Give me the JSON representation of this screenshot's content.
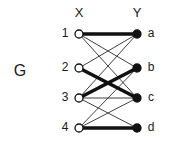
{
  "figure": {
    "graph_name": "G",
    "set_labels": {
      "left": "X",
      "right": "Y"
    },
    "left_vertices": [
      {
        "label": "1",
        "id": "1",
        "cx": 79,
        "cy": 34,
        "style": "open"
      },
      {
        "label": "2",
        "id": "2",
        "cx": 79,
        "cy": 68,
        "style": "open"
      },
      {
        "label": "3",
        "id": "3",
        "cx": 79,
        "cy": 98,
        "style": "open"
      },
      {
        "label": "4",
        "id": "4",
        "cx": 79,
        "cy": 128,
        "style": "open"
      }
    ],
    "right_vertices": [
      {
        "label": "a",
        "id": "a",
        "cx": 137,
        "cy": 34,
        "style": "filled"
      },
      {
        "label": "b",
        "id": "b",
        "cx": 137,
        "cy": 68,
        "style": "filled"
      },
      {
        "label": "c",
        "id": "c",
        "cx": 137,
        "cy": 98,
        "style": "filled"
      },
      {
        "label": "d",
        "id": "d",
        "cx": 137,
        "cy": 128,
        "style": "filled"
      }
    ],
    "edges": [
      {
        "from": "1",
        "to": "a",
        "weight": "thick"
      },
      {
        "from": "1",
        "to": "b",
        "weight": "thin"
      },
      {
        "from": "1",
        "to": "c",
        "weight": "thin"
      },
      {
        "from": "2",
        "to": "a",
        "weight": "thin"
      },
      {
        "from": "2",
        "to": "c",
        "weight": "thick"
      },
      {
        "from": "3",
        "to": "a",
        "weight": "thin"
      },
      {
        "from": "3",
        "to": "b",
        "weight": "thick"
      },
      {
        "from": "3",
        "to": "c",
        "weight": "thin"
      },
      {
        "from": "3",
        "to": "d",
        "weight": "thin"
      },
      {
        "from": "4",
        "to": "b",
        "weight": "thin"
      },
      {
        "from": "4",
        "to": "c",
        "weight": "thin"
      },
      {
        "from": "4",
        "to": "d",
        "weight": "thick"
      }
    ],
    "colors": {
      "edge": "#111111",
      "vertex_open_fill": "#ffffff",
      "vertex_stroke": "#111111",
      "vertex_filled_fill": "#111111",
      "text": "#1a1a1a",
      "background": "#ffffff"
    },
    "geometry": {
      "vertex_radius": 4,
      "thick_width": 3.6,
      "thin_width": 0.8,
      "graph_name_x": 20,
      "graph_name_y": 72,
      "left_set_label_x": 79,
      "left_set_label_y": 14,
      "right_set_label_x": 137,
      "right_set_label_y": 14,
      "left_label_dx": -14,
      "right_label_dx": 14
    }
  }
}
